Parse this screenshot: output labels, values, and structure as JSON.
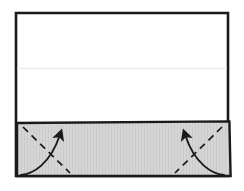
{
  "figure": {
    "background_color": "#ffffff",
    "canvas": {
      "width": 244,
      "height": 191
    }
  },
  "colors": {
    "outline": "#1a1a1a",
    "paper_fill": "#ffffff",
    "flap_fill": "#d4d4d4",
    "flap_texture": "#cacaca",
    "crease_line": "#f0f0f0",
    "dash_line": "#1a1a1a",
    "arrow": "#1a1a1a"
  },
  "shapes": {
    "sheet": {
      "name": "paper-sheet",
      "points": "16,13 228,13 228,176 16,176",
      "fill": "#ffffff",
      "stroke": "#1a1a1a",
      "stroke_width": 2.6
    },
    "faint_crease": {
      "name": "faint-horizontal-crease",
      "x1": 17,
      "y1": 68.5,
      "x2": 227,
      "y2": 68.5,
      "stroke": "#ececec",
      "stroke_width": 1.6
    },
    "flap": {
      "name": "folded-flap-band",
      "points": "17,123 229,121.5 230.5,176 17,176",
      "fill": "#d4d4d4",
      "stroke": "#1a1a1a",
      "stroke_width": 2.4
    }
  },
  "annotations": {
    "left_dash": {
      "name": "left-dashed-crease",
      "path": "M 23,127 L 70,173",
      "dash_pattern": "7 5",
      "stroke_width": 1.7
    },
    "right_dash": {
      "name": "right-dashed-crease",
      "path": "M 222,127 L 175,173",
      "dash_pattern": "7 5",
      "stroke_width": 1.7
    },
    "left_arrow": {
      "name": "left-fold-arrow",
      "path": "M 22,174 C 34,173 50,163 60,136",
      "head_tip": "62,128",
      "stroke_width": 1.9,
      "direction": "up-right"
    },
    "right_arrow": {
      "name": "right-fold-arrow",
      "path": "M 223,174 C 211,173 195,163 185,136",
      "head_tip": "183,128",
      "stroke_width": 1.9,
      "direction": "up-left"
    }
  },
  "labels": {
    "caption": ""
  }
}
